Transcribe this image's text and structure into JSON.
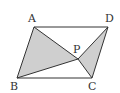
{
  "diagram": {
    "type": "geometry",
    "shape": "parallelogram",
    "colors": {
      "stroke": "#333333",
      "shade": "#cfcfcf",
      "background": "#ffffff"
    },
    "points": {
      "A": {
        "label": "A",
        "x": 34,
        "y": 27,
        "lx": 28,
        "ly": 22
      },
      "D": {
        "label": "D",
        "x": 108,
        "y": 27,
        "lx": 105,
        "ly": 22
      },
      "B": {
        "label": "B",
        "x": 17,
        "y": 78,
        "lx": 10,
        "ly": 90
      },
      "C": {
        "label": "C",
        "x": 92,
        "y": 78,
        "lx": 88,
        "ly": 90
      },
      "P": {
        "label": "P",
        "x": 78,
        "y": 59,
        "lx": 73,
        "ly": 52
      }
    },
    "shaded_triangles": [
      "ABP",
      "PCD"
    ]
  }
}
